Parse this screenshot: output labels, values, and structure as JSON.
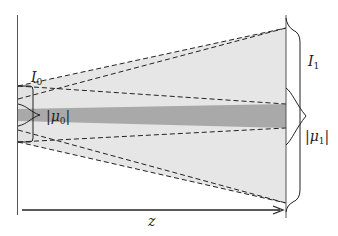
{
  "diagram": {
    "labels": {
      "I0": {
        "base": "I",
        "sub": "0"
      },
      "mu0": {
        "bar_left": "|",
        "base": "μ",
        "sub": "0",
        "bar_right": "|"
      },
      "I1": {
        "base": "I",
        "sub": "1"
      },
      "mu1": {
        "bar_left": "|",
        "base": "μ",
        "sub": "1",
        "bar_right": "|"
      },
      "z": "z"
    },
    "colors": {
      "outer_beam": "#e6e6e6",
      "inner_beam": "#a9a9a9",
      "lines": "#222222",
      "background": "#ffffff"
    }
  }
}
